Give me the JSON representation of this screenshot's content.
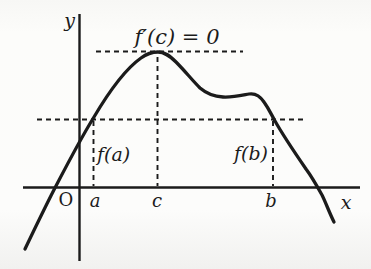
{
  "figure": {
    "background": "#fbfbf9",
    "ink": "#1b1b1b",
    "labels": {
      "y_axis": "y",
      "x_axis": "x",
      "origin": "O",
      "point_a": "a",
      "point_c": "c",
      "point_b": "b",
      "value_fa": "f(a)",
      "value_fb": "f(b)",
      "annotation": "f′(c) = 0"
    }
  }
}
